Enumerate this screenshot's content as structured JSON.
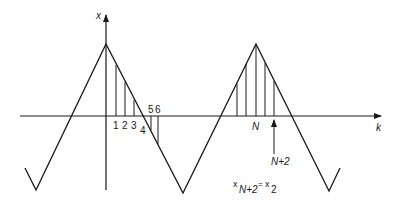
{
  "diagram": {
    "axes": {
      "vertical_label": "x",
      "horizontal_label": "k"
    },
    "sample_labels": [
      "1",
      "2",
      "3",
      "4",
      "5",
      "6"
    ],
    "period_label": "N",
    "marker_label": "N+2",
    "equation": {
      "lhs_base": "x",
      "lhs_sub": "N+2",
      "equals": "=",
      "rhs_base": "x",
      "rhs_sub": "2"
    },
    "colors": {
      "line": "#1a1a1a",
      "background": "#ffffff"
    }
  }
}
